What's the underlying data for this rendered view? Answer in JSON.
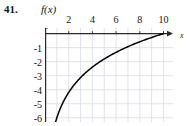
{
  "figure": {
    "problem_number": "41.",
    "function_label": "f(x)",
    "x_axis_name": "x"
  },
  "chart_data": {
    "type": "line",
    "title": "",
    "subtitle": "",
    "xlabel": "x",
    "ylabel": "f(x)",
    "xlim": [
      0,
      10.8
    ],
    "ylim": [
      -6.3,
      0.4
    ],
    "grid": true,
    "legend": null,
    "x_ticks": [
      2,
      4,
      6,
      8,
      10
    ],
    "x_tick_labels": [
      "2",
      "4",
      "6",
      "8",
      "10"
    ],
    "y_ticks": [
      -1,
      -2,
      -3,
      -4,
      -5,
      -6
    ],
    "y_tick_labels": [
      "-1",
      "-2",
      "-3",
      "-4",
      "-5",
      "-6"
    ],
    "x_gridlines": [
      1,
      2,
      3,
      4,
      5,
      6,
      7,
      8,
      9,
      10
    ],
    "y_gridlines": [
      -1,
      -2,
      -3,
      -4,
      -5,
      -6
    ],
    "axis_arrows": [
      "x-positive",
      "y-positive"
    ],
    "curve_color": "#000000",
    "grid_color": "#d8dce4",
    "axis_color": "#2a2a2a",
    "series": [
      {
        "name": "f(x)",
        "description": "logarithmic curve, increasing, concave down, vertical asymptote at x=0, crosses zero near x=10",
        "x": [
          0.12,
          0.15,
          0.2,
          0.3,
          0.4,
          0.5,
          0.65,
          0.8,
          1.0,
          1.3,
          1.6,
          2.0,
          2.5,
          3.0,
          3.5,
          4.0,
          4.5,
          5.0,
          5.5,
          6.0,
          6.5,
          7.0,
          7.5,
          8.0,
          8.5,
          9.0,
          9.5,
          10.0
        ],
        "y": [
          -6.0,
          -5.45,
          -4.7,
          -3.65,
          -2.9,
          -2.33,
          -1.64,
          -1.09,
          -0.55,
          0.0,
          -2.55,
          -2.09,
          -1.8,
          -1.56,
          -1.37,
          -1.19,
          -1.04,
          -0.9,
          -0.78,
          -0.66,
          -0.56,
          -0.46,
          -0.37,
          -0.29,
          -0.21,
          -0.14,
          -0.07,
          0.0
        ]
      }
    ]
  }
}
